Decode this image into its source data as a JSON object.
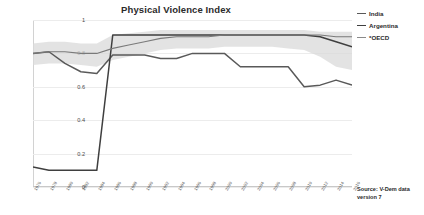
{
  "chart_data": {
    "type": "line",
    "title": "Physical Violence Index",
    "xlabel": "",
    "ylabel": "Rating",
    "ylim": [
      0,
      1
    ],
    "xlim": [
      1976,
      2016
    ],
    "grid": true,
    "legend_position": "top-right",
    "yticks": [
      "1",
      "0.8",
      "0.6",
      "0.4",
      "0.2",
      "0"
    ],
    "ytick_values": [
      1,
      0.8,
      0.6,
      0.4,
      0.2,
      0
    ],
    "categories": [
      1976,
      1978,
      1980,
      1982,
      1984,
      1986,
      1988,
      1990,
      1992,
      1994,
      1996,
      1998,
      2000,
      2002,
      2004,
      2006,
      2008,
      2010,
      2012,
      2014,
      2016
    ],
    "xtick_labels": [
      "1976",
      "1978",
      "1980",
      "1982",
      "1984",
      "1986",
      "1988",
      "1990",
      "1992",
      "1994",
      "1996",
      "1998",
      "2000",
      "2002",
      "2004",
      "2006",
      "2008",
      "2010",
      "2012",
      "2014",
      "2016"
    ],
    "series": [
      {
        "name": "India",
        "color": "#595959",
        "values": [
          0.8,
          0.81,
          0.74,
          0.69,
          0.68,
          0.79,
          0.79,
          0.79,
          0.77,
          0.77,
          0.8,
          0.8,
          0.8,
          0.72,
          0.72,
          0.72,
          0.72,
          0.6,
          0.61,
          0.64,
          0.61
        ]
      },
      {
        "name": "Argentina",
        "color": "#3f3f3f",
        "values": [
          0.12,
          0.1,
          0.1,
          0.1,
          0.1,
          0.91,
          0.91,
          0.91,
          0.91,
          0.91,
          0.91,
          0.91,
          0.91,
          0.91,
          0.91,
          0.91,
          0.91,
          0.91,
          0.9,
          0.87,
          0.84
        ]
      },
      {
        "name": "*OECD",
        "color": "#7a7a7a",
        "values": [
          0.8,
          0.81,
          0.81,
          0.8,
          0.8,
          0.83,
          0.85,
          0.87,
          0.89,
          0.9,
          0.9,
          0.9,
          0.91,
          0.91,
          0.91,
          0.91,
          0.91,
          0.91,
          0.91,
          0.9,
          0.9
        ]
      }
    ],
    "band": {
      "name": "oecd-range-band",
      "color": "#d9d9d9",
      "upper": [
        0.86,
        0.87,
        0.87,
        0.86,
        0.86,
        0.91,
        0.92,
        0.93,
        0.94,
        0.94,
        0.94,
        0.94,
        0.94,
        0.94,
        0.94,
        0.94,
        0.94,
        0.94,
        0.93,
        0.93,
        0.93
      ],
      "lower": [
        0.73,
        0.74,
        0.74,
        0.73,
        0.72,
        0.76,
        0.78,
        0.8,
        0.82,
        0.83,
        0.83,
        0.83,
        0.84,
        0.84,
        0.84,
        0.84,
        0.83,
        0.82,
        0.78,
        0.72,
        0.7
      ]
    }
  },
  "legend": {
    "items": [
      {
        "label": "India",
        "color": "#595959"
      },
      {
        "label": "Argentina",
        "color": "#3f3f3f"
      },
      {
        "label": "*OECD",
        "color": "#8a8a8a"
      }
    ]
  },
  "source": {
    "line1": "Source: V-Dem data",
    "line2": "version 7"
  }
}
